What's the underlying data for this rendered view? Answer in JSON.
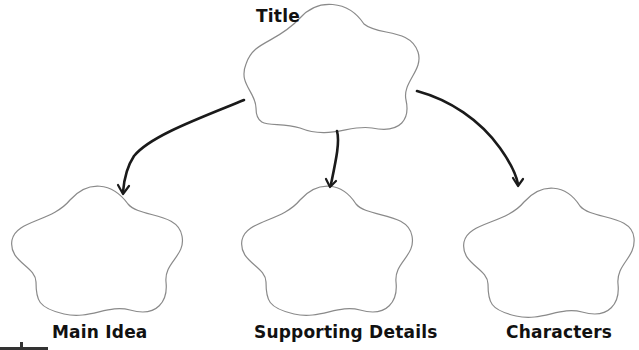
{
  "diagram": {
    "type": "graphic-organizer",
    "root": {
      "label": "Title"
    },
    "children": [
      {
        "label": "Main Idea"
      },
      {
        "label": "Supporting Details"
      },
      {
        "label": "Characters"
      }
    ],
    "colors": {
      "outline": "#8a8a8a",
      "arrow": "#1a1a1a",
      "text": "#111111",
      "background": "#ffffff"
    }
  }
}
